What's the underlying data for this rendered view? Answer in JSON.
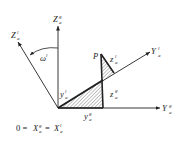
{
  "diagram": {
    "type": "coordinate-rotation",
    "axes": {
      "Z_g": {
        "base": "Z",
        "sup": "g",
        "sub": "a"
      },
      "Z_l": {
        "base": "Z",
        "sup": "l",
        "sub": "a"
      },
      "Y_l": {
        "base": "Y",
        "sup": "l",
        "sub": "a"
      },
      "Y_g": {
        "base": "Y",
        "sup": "g",
        "sub": "a"
      }
    },
    "angle_label": "ω",
    "angle_sup": "l",
    "point_label": "P",
    "components": {
      "y_l": {
        "base": "y",
        "sup": "l",
        "sub": "a"
      },
      "z_l": {
        "base": "z",
        "sup": "l",
        "sub": "a"
      },
      "z_g": {
        "base": "z",
        "sup": "g",
        "sub": "a"
      },
      "y_g": {
        "base": "y",
        "sup": "g",
        "sub": "a"
      }
    },
    "caption": {
      "left": "0 = ",
      "x_g": {
        "base": "X",
        "sup": "g",
        "sub": "a"
      },
      "eq": " = ",
      "x_l": {
        "base": "X",
        "sup": "l",
        "sub": "a"
      }
    }
  }
}
